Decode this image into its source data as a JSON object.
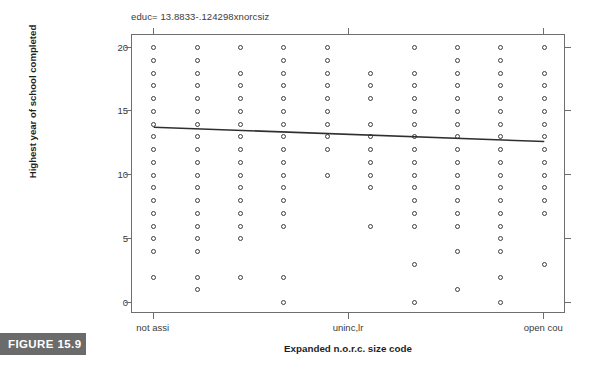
{
  "figure": {
    "tag": "FIGURE 15.9"
  },
  "chart_data": {
    "type": "scatter",
    "title": "educ= 13.8833-.124298xnorcsiz",
    "xlabel": "Expanded n.o.r.c. size code",
    "ylabel": "Highest year of school completed",
    "grid": false,
    "legend": null,
    "xlim": [
      0.5,
      10.5
    ],
    "ylim": [
      -0.9,
      21.0
    ],
    "ytick_values": [
      0,
      5,
      10,
      15,
      20
    ],
    "ytick_labels": [
      "0",
      "5",
      "10",
      "15",
      "20"
    ],
    "xtick_positions": [
      1,
      5.5,
      10
    ],
    "xtick_labels": [
      "not assi",
      "uninc,lr",
      "open cou"
    ],
    "x_categories": [
      1,
      2,
      3,
      4,
      5,
      6,
      7,
      8,
      9,
      10
    ],
    "regression": {
      "equation": "educ= 13.8833-.124298xnorcsiz",
      "intercept": 13.8833,
      "slope": -0.124298,
      "x_start": 1,
      "x_end": 10,
      "y_start": 13.76,
      "y_end": 12.64,
      "color": "#2f2f2f"
    },
    "marker": {
      "shape": "open-circle",
      "edge_color": "#3d3d3d",
      "face_color": "#ffffff",
      "size_px": 5
    },
    "points": [
      {
        "x": 1,
        "y": 20
      },
      {
        "x": 1,
        "y": 19
      },
      {
        "x": 1,
        "y": 18
      },
      {
        "x": 1,
        "y": 17
      },
      {
        "x": 1,
        "y": 16
      },
      {
        "x": 1,
        "y": 15
      },
      {
        "x": 1,
        "y": 14
      },
      {
        "x": 1,
        "y": 13
      },
      {
        "x": 1,
        "y": 12
      },
      {
        "x": 1,
        "y": 11
      },
      {
        "x": 1,
        "y": 10
      },
      {
        "x": 1,
        "y": 9
      },
      {
        "x": 1,
        "y": 8
      },
      {
        "x": 1,
        "y": 7
      },
      {
        "x": 1,
        "y": 6
      },
      {
        "x": 1,
        "y": 5
      },
      {
        "x": 1,
        "y": 4
      },
      {
        "x": 1,
        "y": 2
      },
      {
        "x": 2,
        "y": 20
      },
      {
        "x": 2,
        "y": 19
      },
      {
        "x": 2,
        "y": 18
      },
      {
        "x": 2,
        "y": 17
      },
      {
        "x": 2,
        "y": 16
      },
      {
        "x": 2,
        "y": 15
      },
      {
        "x": 2,
        "y": 14
      },
      {
        "x": 2,
        "y": 13
      },
      {
        "x": 2,
        "y": 12
      },
      {
        "x": 2,
        "y": 11
      },
      {
        "x": 2,
        "y": 10
      },
      {
        "x": 2,
        "y": 9
      },
      {
        "x": 2,
        "y": 8
      },
      {
        "x": 2,
        "y": 7
      },
      {
        "x": 2,
        "y": 6
      },
      {
        "x": 2,
        "y": 5
      },
      {
        "x": 2,
        "y": 4
      },
      {
        "x": 2,
        "y": 2
      },
      {
        "x": 2,
        "y": 1
      },
      {
        "x": 3,
        "y": 20
      },
      {
        "x": 3,
        "y": 18
      },
      {
        "x": 3,
        "y": 17
      },
      {
        "x": 3,
        "y": 16
      },
      {
        "x": 3,
        "y": 15
      },
      {
        "x": 3,
        "y": 14
      },
      {
        "x": 3,
        "y": 13
      },
      {
        "x": 3,
        "y": 12
      },
      {
        "x": 3,
        "y": 11
      },
      {
        "x": 3,
        "y": 10
      },
      {
        "x": 3,
        "y": 9
      },
      {
        "x": 3,
        "y": 8
      },
      {
        "x": 3,
        "y": 7
      },
      {
        "x": 3,
        "y": 6
      },
      {
        "x": 3,
        "y": 5
      },
      {
        "x": 3,
        "y": 2
      },
      {
        "x": 4,
        "y": 20
      },
      {
        "x": 4,
        "y": 19
      },
      {
        "x": 4,
        "y": 18
      },
      {
        "x": 4,
        "y": 17
      },
      {
        "x": 4,
        "y": 16
      },
      {
        "x": 4,
        "y": 15
      },
      {
        "x": 4,
        "y": 14
      },
      {
        "x": 4,
        "y": 13
      },
      {
        "x": 4,
        "y": 12
      },
      {
        "x": 4,
        "y": 11
      },
      {
        "x": 4,
        "y": 10
      },
      {
        "x": 4,
        "y": 9
      },
      {
        "x": 4,
        "y": 8
      },
      {
        "x": 4,
        "y": 7
      },
      {
        "x": 4,
        "y": 6
      },
      {
        "x": 4,
        "y": 2
      },
      {
        "x": 4,
        "y": 0
      },
      {
        "x": 5,
        "y": 20
      },
      {
        "x": 5,
        "y": 19
      },
      {
        "x": 5,
        "y": 18
      },
      {
        "x": 5,
        "y": 17
      },
      {
        "x": 5,
        "y": 16
      },
      {
        "x": 5,
        "y": 15
      },
      {
        "x": 5,
        "y": 14
      },
      {
        "x": 5,
        "y": 13
      },
      {
        "x": 5,
        "y": 12
      },
      {
        "x": 5,
        "y": 10
      },
      {
        "x": 6,
        "y": 18
      },
      {
        "x": 6,
        "y": 17
      },
      {
        "x": 6,
        "y": 16
      },
      {
        "x": 6,
        "y": 14
      },
      {
        "x": 6,
        "y": 13
      },
      {
        "x": 6,
        "y": 12
      },
      {
        "x": 6,
        "y": 11
      },
      {
        "x": 6,
        "y": 10
      },
      {
        "x": 6,
        "y": 9
      },
      {
        "x": 6,
        "y": 6
      },
      {
        "x": 7,
        "y": 20
      },
      {
        "x": 7,
        "y": 18
      },
      {
        "x": 7,
        "y": 17
      },
      {
        "x": 7,
        "y": 16
      },
      {
        "x": 7,
        "y": 15
      },
      {
        "x": 7,
        "y": 14
      },
      {
        "x": 7,
        "y": 13
      },
      {
        "x": 7,
        "y": 12
      },
      {
        "x": 7,
        "y": 11
      },
      {
        "x": 7,
        "y": 10
      },
      {
        "x": 7,
        "y": 9
      },
      {
        "x": 7,
        "y": 8
      },
      {
        "x": 7,
        "y": 7
      },
      {
        "x": 7,
        "y": 6
      },
      {
        "x": 7,
        "y": 3
      },
      {
        "x": 7,
        "y": 0
      },
      {
        "x": 8,
        "y": 20
      },
      {
        "x": 8,
        "y": 19
      },
      {
        "x": 8,
        "y": 18
      },
      {
        "x": 8,
        "y": 17
      },
      {
        "x": 8,
        "y": 16
      },
      {
        "x": 8,
        "y": 15
      },
      {
        "x": 8,
        "y": 14
      },
      {
        "x": 8,
        "y": 13
      },
      {
        "x": 8,
        "y": 12
      },
      {
        "x": 8,
        "y": 11
      },
      {
        "x": 8,
        "y": 10
      },
      {
        "x": 8,
        "y": 9
      },
      {
        "x": 8,
        "y": 8
      },
      {
        "x": 8,
        "y": 7
      },
      {
        "x": 8,
        "y": 6
      },
      {
        "x": 8,
        "y": 4
      },
      {
        "x": 8,
        "y": 1
      },
      {
        "x": 9,
        "y": 20
      },
      {
        "x": 9,
        "y": 19
      },
      {
        "x": 9,
        "y": 18
      },
      {
        "x": 9,
        "y": 17
      },
      {
        "x": 9,
        "y": 16
      },
      {
        "x": 9,
        "y": 15
      },
      {
        "x": 9,
        "y": 14
      },
      {
        "x": 9,
        "y": 13
      },
      {
        "x": 9,
        "y": 12
      },
      {
        "x": 9,
        "y": 11
      },
      {
        "x": 9,
        "y": 10
      },
      {
        "x": 9,
        "y": 9
      },
      {
        "x": 9,
        "y": 8
      },
      {
        "x": 9,
        "y": 7
      },
      {
        "x": 9,
        "y": 6
      },
      {
        "x": 9,
        "y": 5
      },
      {
        "x": 9,
        "y": 4
      },
      {
        "x": 9,
        "y": 2
      },
      {
        "x": 9,
        "y": 0
      },
      {
        "x": 10,
        "y": 20
      },
      {
        "x": 10,
        "y": 18
      },
      {
        "x": 10,
        "y": 17
      },
      {
        "x": 10,
        "y": 16
      },
      {
        "x": 10,
        "y": 15
      },
      {
        "x": 10,
        "y": 14
      },
      {
        "x": 10,
        "y": 13
      },
      {
        "x": 10,
        "y": 12
      },
      {
        "x": 10,
        "y": 11
      },
      {
        "x": 10,
        "y": 10
      },
      {
        "x": 10,
        "y": 9
      },
      {
        "x": 10,
        "y": 8
      },
      {
        "x": 10,
        "y": 7
      },
      {
        "x": 10,
        "y": 3
      }
    ]
  }
}
